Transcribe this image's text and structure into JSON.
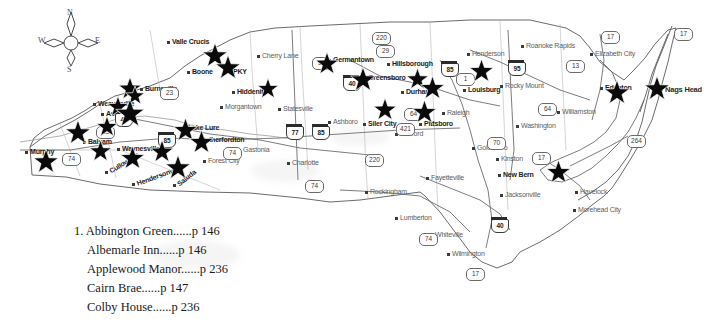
{
  "compass": {
    "north": "N",
    "east": "E",
    "south": "S",
    "west": "W"
  },
  "legend": {
    "items": [
      {
        "number": "1.",
        "name": "Abbington Green",
        "dots": "......",
        "page": "p 146"
      },
      {
        "number": "",
        "name": "Albemarle Inn",
        "dots": "......",
        "page": "p 146"
      },
      {
        "number": "",
        "name": "Applewood Manor",
        "dots": "......",
        "page": "p 236"
      },
      {
        "number": "",
        "name": "Cairn Brae",
        "dots": "......",
        "page": "p 147"
      },
      {
        "number": "",
        "name": "Colby House",
        "dots": "......",
        "page": "p 236"
      }
    ]
  },
  "cities": [
    {
      "label": "Murphy",
      "x": 30,
      "y": 148,
      "style": "dk"
    },
    {
      "label": "Balsam",
      "x": 88,
      "y": 138,
      "style": "dk"
    },
    {
      "label": "Waynesville",
      "x": 122,
      "y": 145,
      "style": "dk"
    },
    {
      "label": "Cullowhee",
      "x": 110,
      "y": 168,
      "style": "tilt dk"
    },
    {
      "label": "Hendersonville",
      "x": 137,
      "y": 180,
      "style": "tilt3 dk"
    },
    {
      "label": "Saluda",
      "x": 178,
      "y": 181,
      "style": "tilt2 dk"
    },
    {
      "label": "Weaverville",
      "x": 98,
      "y": 100,
      "style": "dk"
    },
    {
      "label": "Asheville",
      "x": 106,
      "y": 110,
      "style": "dk"
    },
    {
      "label": "Burnsville",
      "x": 145,
      "y": 85,
      "style": "dk"
    },
    {
      "label": "Lake Lure",
      "x": 188,
      "y": 124,
      "style": "dk"
    },
    {
      "label": "Rutherfordton",
      "x": 200,
      "y": 136,
      "style": "dk"
    },
    {
      "label": "Forest City",
      "x": 208,
      "y": 157,
      "style": ""
    },
    {
      "label": "Gastonia",
      "x": 243,
      "y": 146,
      "style": ""
    },
    {
      "label": "Valle Crucis",
      "x": 172,
      "y": 38,
      "style": "dk"
    },
    {
      "label": "Boone",
      "x": 192,
      "y": 68,
      "style": "dk"
    },
    {
      "label": "PKY",
      "x": 233,
      "y": 68,
      "style": "dk"
    },
    {
      "label": "Cherry Lane",
      "x": 262,
      "y": 52,
      "style": "two"
    },
    {
      "label": "Hiddenite",
      "x": 237,
      "y": 88,
      "style": "dk"
    },
    {
      "label": "Morgantown",
      "x": 225,
      "y": 103,
      "style": ""
    },
    {
      "label": "Statesville",
      "x": 283,
      "y": 105,
      "style": ""
    },
    {
      "label": "Charlotte",
      "x": 292,
      "y": 159,
      "style": ""
    },
    {
      "label": "Ashboro",
      "x": 333,
      "y": 118,
      "style": ""
    },
    {
      "label": "Siler City",
      "x": 368,
      "y": 120,
      "style": "dk"
    },
    {
      "label": "Sanford",
      "x": 400,
      "y": 130,
      "style": ""
    },
    {
      "label": "Rockingham",
      "x": 370,
      "y": 188,
      "style": ""
    },
    {
      "label": "Germantown",
      "x": 333,
      "y": 56,
      "style": "dk"
    },
    {
      "label": "Greensboro",
      "x": 368,
      "y": 74,
      "style": "dk"
    },
    {
      "label": "Hillsborough",
      "x": 392,
      "y": 60,
      "style": "dk"
    },
    {
      "label": "Durham",
      "x": 406,
      "y": 88,
      "style": "dk"
    },
    {
      "label": "Pittsboro",
      "x": 424,
      "y": 120,
      "style": "dk"
    },
    {
      "label": "Raleigh",
      "x": 447,
      "y": 109,
      "style": ""
    },
    {
      "label": "Henderson",
      "x": 472,
      "y": 50,
      "style": ""
    },
    {
      "label": "Louisburg",
      "x": 468,
      "y": 86,
      "style": "dk"
    },
    {
      "label": "Roanoke Rapids",
      "x": 526,
      "y": 42,
      "style": "two"
    },
    {
      "label": "Rocky Mount",
      "x": 505,
      "y": 82,
      "style": ""
    },
    {
      "label": "Washington",
      "x": 521,
      "y": 122,
      "style": ""
    },
    {
      "label": "Goldsboro",
      "x": 477,
      "y": 144,
      "style": ""
    },
    {
      "label": "Kinston",
      "x": 501,
      "y": 155,
      "style": ""
    },
    {
      "label": "Williamston",
      "x": 562,
      "y": 108,
      "style": ""
    },
    {
      "label": "Elizabeth City",
      "x": 595,
      "y": 50,
      "style": "two"
    },
    {
      "label": "Edenton",
      "x": 605,
      "y": 84,
      "style": "dk"
    },
    {
      "label": "Nags Head",
      "x": 665,
      "y": 85,
      "style": "b2"
    },
    {
      "label": "New Bern",
      "x": 503,
      "y": 171,
      "style": "dk"
    },
    {
      "label": "Havelock",
      "x": 580,
      "y": 188,
      "style": ""
    },
    {
      "label": "Morehead City",
      "x": 578,
      "y": 206,
      "style": "two"
    },
    {
      "label": "Jacksonville",
      "x": 505,
      "y": 191,
      "style": ""
    },
    {
      "label": "Wilmington",
      "x": 452,
      "y": 250,
      "style": ""
    },
    {
      "label": "Whiteville",
      "x": 435,
      "y": 231,
      "style": ""
    },
    {
      "label": "Lumberton",
      "x": 400,
      "y": 214,
      "style": ""
    },
    {
      "label": "Fayetteville",
      "x": 431,
      "y": 174,
      "style": ""
    }
  ],
  "shields": [
    {
      "label": "74",
      "x": 62,
      "y": 153,
      "type": "us"
    },
    {
      "label": "23",
      "x": 96,
      "y": 126,
      "type": "us"
    },
    {
      "label": "23",
      "x": 160,
      "y": 87,
      "type": "us"
    },
    {
      "label": "40",
      "x": 115,
      "y": 113,
      "type": "interstate"
    },
    {
      "label": "85",
      "x": 158,
      "y": 134,
      "type": "interstate"
    },
    {
      "label": "74",
      "x": 223,
      "y": 147,
      "type": "us"
    },
    {
      "label": "77",
      "x": 286,
      "y": 126,
      "type": "interstate"
    },
    {
      "label": "85",
      "x": 312,
      "y": 126,
      "type": "interstate"
    },
    {
      "label": "74",
      "x": 305,
      "y": 180,
      "type": "us"
    },
    {
      "label": "220",
      "x": 365,
      "y": 154,
      "type": "us"
    },
    {
      "label": "52",
      "x": 312,
      "y": 57,
      "type": "us"
    },
    {
      "label": "220",
      "x": 372,
      "y": 32,
      "type": "us"
    },
    {
      "label": "29",
      "x": 376,
      "y": 45,
      "type": "us"
    },
    {
      "label": "40",
      "x": 343,
      "y": 77,
      "type": "interstate"
    },
    {
      "label": "64",
      "x": 404,
      "y": 108,
      "type": "us"
    },
    {
      "label": "421",
      "x": 396,
      "y": 123,
      "type": "us"
    },
    {
      "label": "85",
      "x": 441,
      "y": 63,
      "type": "interstate"
    },
    {
      "label": "1",
      "x": 456,
      "y": 73,
      "type": "us"
    },
    {
      "label": "95",
      "x": 508,
      "y": 62,
      "type": "interstate"
    },
    {
      "label": "13",
      "x": 566,
      "y": 60,
      "type": "us"
    },
    {
      "label": "64",
      "x": 538,
      "y": 103,
      "type": "us"
    },
    {
      "label": "70",
      "x": 487,
      "y": 137,
      "type": "us"
    },
    {
      "label": "17",
      "x": 601,
      "y": 31,
      "type": "us"
    },
    {
      "label": "17",
      "x": 674,
      "y": 28,
      "type": "us"
    },
    {
      "label": "264",
      "x": 627,
      "y": 135,
      "type": "us"
    },
    {
      "label": "17",
      "x": 532,
      "y": 152,
      "type": "us"
    },
    {
      "label": "40",
      "x": 491,
      "y": 219,
      "type": "interstate"
    },
    {
      "label": "74",
      "x": 419,
      "y": 233,
      "type": "us"
    },
    {
      "label": "17",
      "x": 466,
      "y": 268,
      "type": "us"
    }
  ],
  "stars": [
    {
      "name": "valle-crucis",
      "x": 215,
      "y": 56,
      "size": 26
    },
    {
      "name": "boone",
      "x": 228,
      "y": 68,
      "size": 26
    },
    {
      "name": "hiddenite",
      "x": 268,
      "y": 89,
      "size": 22
    },
    {
      "name": "burnsville",
      "x": 130,
      "y": 89,
      "size": 24
    },
    {
      "name": "weaverville",
      "x": 135,
      "y": 96,
      "size": 20
    },
    {
      "name": "asheville-1",
      "x": 118,
      "y": 107,
      "size": 22
    },
    {
      "name": "asheville-2",
      "x": 130,
      "y": 114,
      "size": 30
    },
    {
      "name": "asheville-3",
      "x": 107,
      "y": 127,
      "size": 22
    },
    {
      "name": "balsam",
      "x": 78,
      "y": 133,
      "size": 26
    },
    {
      "name": "waynesville",
      "x": 100,
      "y": 151,
      "size": 23
    },
    {
      "name": "cullowhee",
      "x": 132,
      "y": 158,
      "size": 25
    },
    {
      "name": "hendersonvl",
      "x": 162,
      "y": 152,
      "size": 24
    },
    {
      "name": "saluda",
      "x": 178,
      "y": 168,
      "size": 26
    },
    {
      "name": "murphy",
      "x": 46,
      "y": 162,
      "size": 26
    },
    {
      "name": "lake-lure",
      "x": 185,
      "y": 130,
      "size": 25
    },
    {
      "name": "rutherfordton",
      "x": 201,
      "y": 142,
      "size": 25
    },
    {
      "name": "germantown",
      "x": 327,
      "y": 64,
      "size": 24
    },
    {
      "name": "greensboro",
      "x": 363,
      "y": 80,
      "size": 26
    },
    {
      "name": "hillsborough",
      "x": 417,
      "y": 79,
      "size": 23
    },
    {
      "name": "durham",
      "x": 432,
      "y": 88,
      "size": 25
    },
    {
      "name": "siler-city",
      "x": 385,
      "y": 110,
      "size": 24
    },
    {
      "name": "pittsboro",
      "x": 424,
      "y": 112,
      "size": 25
    },
    {
      "name": "louisburg",
      "x": 481,
      "y": 71,
      "size": 25
    },
    {
      "name": "edenton",
      "x": 617,
      "y": 93,
      "size": 26
    },
    {
      "name": "nags-head",
      "x": 657,
      "y": 89,
      "size": 26
    },
    {
      "name": "new-bern",
      "x": 558,
      "y": 172,
      "size": 25
    }
  ]
}
